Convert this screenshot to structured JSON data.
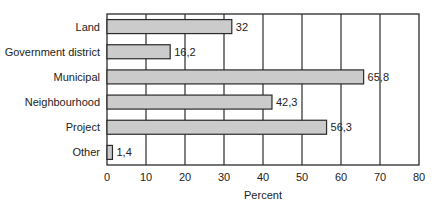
{
  "chart_data": {
    "type": "bar",
    "orientation": "horizontal",
    "title": "",
    "xlabel": "Percent",
    "ylabel": "",
    "categories": [
      "Land",
      "Government district",
      "Municipal",
      "Neighbourhood",
      "Project",
      "Other"
    ],
    "values": [
      32,
      16.2,
      65.8,
      42.3,
      56.3,
      1.4
    ],
    "value_labels": [
      "32",
      "16,2",
      "65,8",
      "42,3",
      "56,3",
      "1,4"
    ],
    "xlim": [
      0,
      80
    ],
    "xticks": [
      0,
      10,
      20,
      30,
      40,
      50,
      60,
      70,
      80
    ],
    "xtick_labels": [
      "0",
      "10",
      "20",
      "30",
      "40",
      "50",
      "60",
      "70",
      "80"
    ],
    "grid": "vertical",
    "legend": "none",
    "colors": {
      "bar_fill": "#cbcbcb",
      "bar_stroke": "#2a2a2a",
      "grid": "#2a2a2a"
    }
  }
}
